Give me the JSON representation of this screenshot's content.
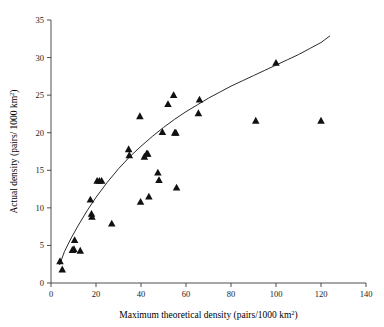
{
  "chart_data": {
    "type": "scatter",
    "title": "",
    "xlabel": "Maximum theoretical density (pairs/1000 km",
    "xlabel_sup": "2",
    "xlabel_tail": ")",
    "ylabel": "Actual density (pairs/ 1000 km",
    "ylabel_sup": "2",
    "ylabel_tail": ")",
    "xlim": [
      0,
      140
    ],
    "ylim": [
      0,
      35
    ],
    "xticks": [
      0,
      20,
      40,
      60,
      80,
      100,
      120,
      140
    ],
    "yticks": [
      0,
      5,
      10,
      15,
      20,
      25,
      30,
      35
    ],
    "xtick_labels": [
      "0",
      "20",
      "40",
      "60",
      "80",
      "100",
      "120",
      "140"
    ],
    "ytick_labels": [
      "0",
      "5",
      "10",
      "15",
      "20",
      "25",
      "30",
      "35"
    ],
    "grid": false,
    "legend": false,
    "marker_shape": "triangle-up",
    "marker_color": "#111111",
    "points": [
      [
        4.0,
        2.9
      ],
      [
        5.0,
        1.8
      ],
      [
        9.5,
        4.4
      ],
      [
        10.2,
        4.5
      ],
      [
        10.5,
        5.7
      ],
      [
        13.0,
        4.3
      ],
      [
        17.5,
        11.1
      ],
      [
        18.0,
        9.2
      ],
      [
        18.2,
        8.8
      ],
      [
        20.5,
        13.6
      ],
      [
        21.5,
        13.6
      ],
      [
        22.5,
        13.6
      ],
      [
        27.0,
        7.9
      ],
      [
        34.5,
        17.8
      ],
      [
        34.8,
        17.0
      ],
      [
        39.5,
        22.2
      ],
      [
        39.8,
        10.8
      ],
      [
        41.5,
        16.8
      ],
      [
        42.5,
        17.2
      ],
      [
        43.0,
        17.2
      ],
      [
        43.5,
        11.5
      ],
      [
        47.5,
        14.7
      ],
      [
        48.0,
        13.7
      ],
      [
        49.5,
        20.1
      ],
      [
        52.0,
        23.8
      ],
      [
        54.5,
        25.0
      ],
      [
        55.0,
        20.0
      ],
      [
        55.5,
        20.0
      ],
      [
        55.8,
        12.7
      ],
      [
        65.5,
        22.6
      ],
      [
        66.0,
        24.4
      ],
      [
        91.0,
        21.6
      ],
      [
        100.0,
        29.3
      ],
      [
        120.0,
        21.6
      ]
    ],
    "fit_curve": {
      "type": "logarithmic",
      "description": "monotonic saturating fit line through the point cloud",
      "points": [
        [
          3.8,
          2.4
        ],
        [
          6.0,
          4.2
        ],
        [
          9.0,
          6.0
        ],
        [
          12.0,
          7.6
        ],
        [
          16.0,
          9.6
        ],
        [
          20.0,
          11.4
        ],
        [
          25.0,
          13.4
        ],
        [
          30.0,
          15.2
        ],
        [
          35.0,
          16.8
        ],
        [
          40.0,
          18.2
        ],
        [
          45.0,
          19.5
        ],
        [
          50.0,
          20.7
        ],
        [
          55.0,
          21.8
        ],
        [
          60.0,
          22.8
        ],
        [
          65.0,
          23.7
        ],
        [
          70.0,
          24.6
        ],
        [
          75.0,
          25.4
        ],
        [
          80.0,
          26.2
        ],
        [
          85.0,
          26.9
        ],
        [
          90.0,
          27.6
        ],
        [
          95.0,
          28.3
        ],
        [
          100.0,
          29.0
        ],
        [
          105.0,
          29.7
        ],
        [
          110.0,
          30.4
        ],
        [
          115.0,
          31.2
        ],
        [
          120.0,
          32.0
        ],
        [
          124.0,
          32.9
        ]
      ]
    }
  }
}
